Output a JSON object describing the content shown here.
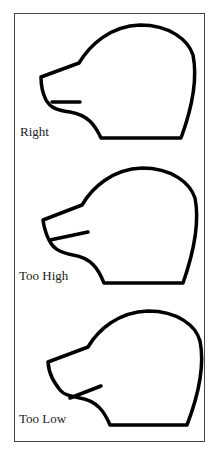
{
  "panels": [
    {
      "label": "Right",
      "mouth": "level"
    },
    {
      "label": "Too High",
      "mouth": "angled-up"
    },
    {
      "label": "Too Low",
      "mouth": "angled-down-from-chin"
    }
  ],
  "colors": {
    "stroke": "#000000",
    "frame": "#444444",
    "background": "#ffffff"
  }
}
